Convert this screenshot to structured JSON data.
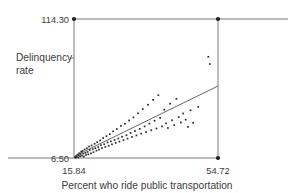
{
  "chart_data": {
    "type": "scatter",
    "title": "",
    "xlabel": "Percent who ride public transportation",
    "ylabel": "Delinquency rate",
    "ylabel_line1": "Delinquency",
    "ylabel_line2": "rate",
    "xlim": [
      15.84,
      54.72
    ],
    "ylim": [
      6.5,
      114.3
    ],
    "xticks": [
      15.84,
      54.72
    ],
    "xtick_labels": [
      "15.84",
      "54.72"
    ],
    "yticks": [
      6.5,
      114.3
    ],
    "ytick_labels": [
      "6.50",
      "114.30"
    ],
    "grid": false,
    "legend": "none",
    "axis_style": "floating-range-frame",
    "fit_line": {
      "label": "least-squares regression line",
      "x_start": 15.84,
      "y_start": 8.4,
      "x_end": 54.72,
      "y_end": 58.0
    },
    "x": [
      16.1,
      16.3,
      16.4,
      16.6,
      16.8,
      17.0,
      17.1,
      17.3,
      17.5,
      17.6,
      17.8,
      18.0,
      18.1,
      18.3,
      18.5,
      18.7,
      18.9,
      19.1,
      19.3,
      19.5,
      19.7,
      19.9,
      20.1,
      20.4,
      20.6,
      20.9,
      21.1,
      21.4,
      21.6,
      21.9,
      22.1,
      22.4,
      22.6,
      22.9,
      23.1,
      23.4,
      23.7,
      24.0,
      24.3,
      24.6,
      24.9,
      25.2,
      25.5,
      25.8,
      26.1,
      26.4,
      26.8,
      27.1,
      27.4,
      27.8,
      28.1,
      28.5,
      28.8,
      29.2,
      29.6,
      30.0,
      30.3,
      30.7,
      31.1,
      31.5,
      31.9,
      32.3,
      32.7,
      33.1,
      33.6,
      34.0,
      34.4,
      34.9,
      35.3,
      35.8,
      36.2,
      36.7,
      37.2,
      37.6,
      38.1,
      38.6,
      39.1,
      39.6,
      40.2,
      40.7,
      41.2,
      41.8,
      42.3,
      42.9,
      43.5,
      44.1,
      44.7,
      45.3,
      46.0,
      46.6,
      47.3,
      48.0,
      49.4,
      52.1,
      52.5
    ],
    "y": [
      7.2,
      6.8,
      8.0,
      7.4,
      9.1,
      6.9,
      8.6,
      10.2,
      7.8,
      9.6,
      11.4,
      8.3,
      12.0,
      9.9,
      7.6,
      13.1,
      10.5,
      8.9,
      14.0,
      11.2,
      9.3,
      15.4,
      12.6,
      10.1,
      16.2,
      13.3,
      11.0,
      17.5,
      14.1,
      12.2,
      18.8,
      15.0,
      13.0,
      20.1,
      16.4,
      14.2,
      22.0,
      17.2,
      15.1,
      23.4,
      18.6,
      16.0,
      25.0,
      19.4,
      17.1,
      27.2,
      20.5,
      18.2,
      29.0,
      21.6,
      19.2,
      31.4,
      23.0,
      20.4,
      33.1,
      24.2,
      21.5,
      35.6,
      26.0,
      22.8,
      38.0,
      27.4,
      24.0,
      41.2,
      29.1,
      25.4,
      44.5,
      31.0,
      26.6,
      47.8,
      33.2,
      28.0,
      51.6,
      35.4,
      29.4,
      55.2,
      37.6,
      31.0,
      44.0,
      33.4,
      29.8,
      48.6,
      35.8,
      32.0,
      52.4,
      38.2,
      34.0,
      41.0,
      36.2,
      30.6,
      43.5,
      33.8,
      46.2,
      85.0,
      79.4
    ]
  }
}
